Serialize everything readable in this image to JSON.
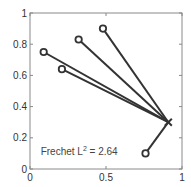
{
  "chart_data": {
    "type": "scatter",
    "title": "",
    "xlabel": "",
    "ylabel": "",
    "xlim": [
      0,
      1
    ],
    "ylim": [
      0,
      1
    ],
    "grid": false,
    "legend": null,
    "x_ticks": [
      0,
      0.5,
      1
    ],
    "x_tick_labels": [
      "0",
      "0.5",
      "1"
    ],
    "y_ticks": [
      0,
      0.2,
      0.4,
      0.6,
      0.8,
      1
    ],
    "y_tick_labels": [
      "0",
      "0.2",
      "0.4",
      "0.6",
      "0.8",
      "1"
    ],
    "center": {
      "marker": "x",
      "x": 0.91,
      "y": 0.3
    },
    "points": [
      {
        "marker": "o",
        "x": 0.09,
        "y": 0.75
      },
      {
        "marker": "o",
        "x": 0.21,
        "y": 0.64
      },
      {
        "marker": "o",
        "x": 0.32,
        "y": 0.83
      },
      {
        "marker": "o",
        "x": 0.48,
        "y": 0.9
      },
      {
        "marker": "o",
        "x": 0.76,
        "y": 0.1
      }
    ],
    "annotation": {
      "prefix": "Frechet L",
      "superscript": "2",
      "suffix": " = 2.64",
      "x": 0.07,
      "y": 0.09
    },
    "colors": {
      "line": "#333333",
      "axis": "#888888",
      "text": "#444444"
    }
  }
}
